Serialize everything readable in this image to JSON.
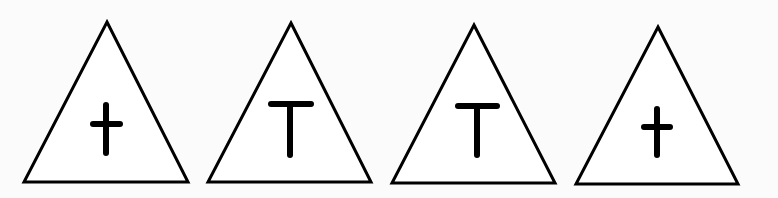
{
  "figure": {
    "background": "#fbfbfb",
    "stroke_color": "#000000",
    "fill_color": "#ffffff",
    "items": [
      {
        "shape": "triangle",
        "symbol": "cross",
        "label": "†",
        "points": [
          [
            107,
            22
          ],
          [
            188,
            182
          ],
          [
            24,
            182
          ]
        ],
        "glyph": {
          "v": [
            106,
            105,
            106,
            153
          ],
          "h": [
            93,
            124,
            120,
            124
          ]
        }
      },
      {
        "shape": "triangle",
        "symbol": "T",
        "label": "T",
        "points": [
          [
            291,
            23
          ],
          [
            371,
            182
          ],
          [
            208,
            182
          ]
        ],
        "glyph": {
          "v": [
            290,
            104,
            290,
            155
          ],
          "h": [
            271,
            104,
            311,
            104
          ]
        }
      },
      {
        "shape": "triangle",
        "symbol": "T",
        "label": "T",
        "points": [
          [
            474,
            25
          ],
          [
            555,
            183
          ],
          [
            392,
            183
          ]
        ],
        "glyph": {
          "v": [
            477,
            106,
            477,
            155
          ],
          "h": [
            458,
            106,
            497,
            106
          ]
        }
      },
      {
        "shape": "triangle",
        "symbol": "cross",
        "label": "†",
        "points": [
          [
            658,
            27
          ],
          [
            738,
            184
          ],
          [
            576,
            184
          ]
        ],
        "glyph": {
          "v": [
            657,
            109,
            657,
            155
          ],
          "h": [
            644,
            127,
            670,
            127
          ]
        }
      }
    ]
  }
}
